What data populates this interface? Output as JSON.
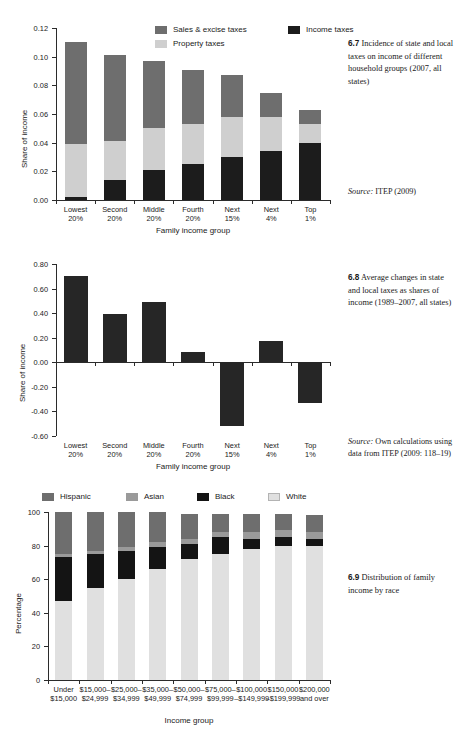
{
  "page": {
    "background": "#ffffff",
    "width": 464,
    "height": 738
  },
  "palette": {
    "sales_excise": "#6e6e6e",
    "property": "#cfcfcf",
    "income": "#1c1c1c",
    "hispanic": "#6e6e6e",
    "asian": "#9a9a9a",
    "black": "#141414",
    "white_race": "#e0e0e0",
    "bar_dark": "#262626",
    "axis": "#2b2b2b"
  },
  "figures": [
    {
      "id": "6.7",
      "caption_number": "6.7",
      "caption_text": "Incidence of state and local taxes on income of different household groups (2007, all states)",
      "source_prefix": "Source:",
      "source_text": " ITEP (2009)"
    },
    {
      "id": "6.8",
      "caption_number": "6.8",
      "caption_text": "Average changes in state and local taxes as shares of income (1989–2007, all states)",
      "source_prefix": "Source:",
      "source_text": " Own calculations using data  from ITEP (2009: 118–19)"
    },
    {
      "id": "6.9",
      "caption_number": "6.9",
      "caption_text": "Distribution of family income by race",
      "source_prefix": "",
      "source_text": ""
    }
  ],
  "chart_data": [
    {
      "type": "bar",
      "stacked": true,
      "title": "Incidence of state and local taxes on income of different household groups (2007, all states)",
      "xlabel": "Family income group",
      "ylabel": "Share of income",
      "ylim": [
        0,
        0.12
      ],
      "yticks": [
        0.0,
        0.02,
        0.04,
        0.06,
        0.08,
        0.1,
        0.12
      ],
      "ytick_labels": [
        "0.00",
        "0.02",
        "0.04",
        "0.06",
        "0.08",
        "0.10",
        "0.12"
      ],
      "grid": false,
      "legend_position": "top-center",
      "categories": [
        "Lowest\n20%",
        "Second\n20%",
        "Middle\n20%",
        "Fourth\n20%",
        "Next\n15%",
        "Next\n4%",
        "Top\n1%"
      ],
      "series": [
        {
          "name": "Income taxes",
          "color": "#1c1c1c",
          "values": [
            0.002,
            0.014,
            0.021,
            0.025,
            0.03,
            0.034,
            0.04
          ]
        },
        {
          "name": "Property taxes",
          "color": "#cfcfcf",
          "values": [
            0.037,
            0.027,
            0.029,
            0.028,
            0.028,
            0.024,
            0.013
          ]
        },
        {
          "name": "Sales & excise taxes",
          "color": "#6e6e6e",
          "values": [
            0.071,
            0.06,
            0.047,
            0.038,
            0.029,
            0.017,
            0.01
          ]
        }
      ],
      "totals": [
        0.11,
        0.101,
        0.097,
        0.091,
        0.087,
        0.075,
        0.063
      ]
    },
    {
      "type": "bar",
      "stacked": false,
      "title": "Average changes in state and local taxes as shares of income (1989–2007, all states)",
      "xlabel": "Family income group",
      "ylabel": "Share of income",
      "ylim": [
        -0.6,
        0.8
      ],
      "yticks": [
        -0.6,
        -0.4,
        -0.2,
        0.0,
        0.2,
        0.4,
        0.6,
        0.8
      ],
      "ytick_labels": [
        "-0.60",
        "-0.40",
        "-0.20",
        "0.00",
        "0.20",
        "0.40",
        "0.60",
        "0.80"
      ],
      "grid": false,
      "legend_position": "none",
      "categories": [
        "Lowest\n20%",
        "Second\n20%",
        "Middle\n20%",
        "Fourth\n20%",
        "Next\n15%",
        "Next\n4%",
        "Top\n1%"
      ],
      "values": [
        0.7,
        0.39,
        0.49,
        0.08,
        -0.52,
        0.17,
        -0.33
      ],
      "color": "#262626"
    },
    {
      "type": "bar",
      "stacked": true,
      "title": "Distribution of family income by race",
      "xlabel": "Income group",
      "ylabel": "Percentage",
      "ylim": [
        0,
        100
      ],
      "yticks": [
        0,
        20,
        40,
        60,
        80,
        100
      ],
      "ytick_labels": [
        "0",
        "20",
        "40",
        "60",
        "80",
        "100"
      ],
      "grid": false,
      "legend_position": "top-left",
      "categories": [
        "Under\n$15,000",
        "$15,000–\n$24,999",
        "$25,000–\n$34,999",
        "$35,000–\n$49,999",
        "$50,000–\n$74,999",
        "$75,000–\n$99,999",
        "$100,000\n–$149,999",
        "$150,000\n–$199,999",
        "$200,000\nand over"
      ],
      "series": [
        {
          "name": "White",
          "color": "#e0e0e0",
          "values": [
            47,
            55,
            60,
            66,
            72,
            75,
            78,
            80,
            80
          ]
        },
        {
          "name": "Black",
          "color": "#141414",
          "values": [
            26,
            20,
            17,
            13,
            9,
            10,
            6,
            5,
            4
          ]
        },
        {
          "name": "Asian",
          "color": "#9a9a9a",
          "values": [
            2,
            2,
            2,
            3,
            3,
            3,
            4,
            4,
            4
          ]
        },
        {
          "name": "Hispanic",
          "color": "#6e6e6e",
          "values": [
            25,
            23,
            21,
            18,
            15,
            11,
            11,
            10,
            10
          ]
        }
      ]
    }
  ]
}
